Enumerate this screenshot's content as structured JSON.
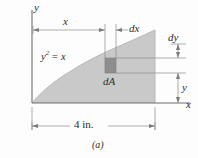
{
  "figure": {
    "caption": "(a)",
    "axes": {
      "y_label": "y",
      "x_label": "x"
    },
    "curve": {
      "equation_base": "y",
      "equation_exponent": "2",
      "equation_rest": "= x",
      "equation_full": "y2 = x",
      "type": "parabola",
      "description": "y squared equals x, opening rightward from origin"
    },
    "dimensions": [
      {
        "name": "x",
        "label": "x",
        "orientation": "horizontal",
        "position": "top"
      },
      {
        "name": "dx",
        "label": "dx",
        "orientation": "horizontal",
        "position": "top-right"
      },
      {
        "name": "dy",
        "label": "dy",
        "orientation": "vertical",
        "position": "right-upper"
      },
      {
        "name": "y",
        "label": "y",
        "orientation": "vertical",
        "position": "right-lower"
      },
      {
        "name": "width",
        "label": "4 in.",
        "orientation": "horizontal",
        "position": "bottom"
      }
    ],
    "element": {
      "label": "dA",
      "description": "differential area element strip"
    },
    "colors": {
      "shaded_region": "#c9c9c9",
      "element_fill": "#8e8e8e",
      "line": "#7a7a7a",
      "text": "#2b2b2b",
      "background": "#fdfdfd"
    }
  }
}
